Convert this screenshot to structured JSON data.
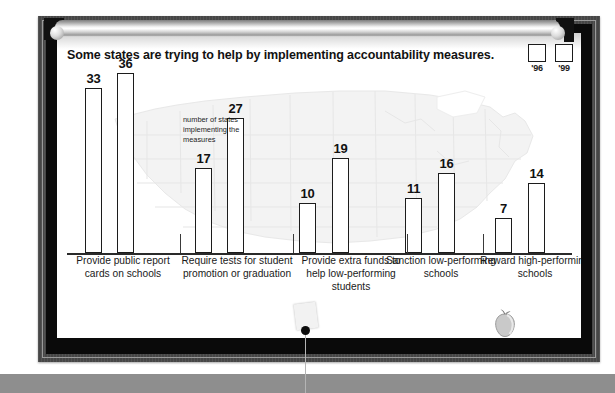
{
  "title": "Some states are trying to help by implementing accountability measures.",
  "annotation": "number of states implementing the measures",
  "legend": [
    {
      "label": "'96"
    },
    {
      "label": "'99"
    }
  ],
  "colors": {
    "bar_fill": "#ffffff",
    "bar_outline": "#1c1c1c",
    "frame": "#4a4a4a",
    "matte": "#0a0a0a",
    "bottom_band": "#8e8e8e",
    "text": "#111111"
  },
  "chart_data": {
    "type": "bar",
    "title": "Some states are trying to help by implementing accountability measures.",
    "xlabel": "",
    "ylabel": "number of states implementing the measures",
    "ylim": [
      0,
      40
    ],
    "grid": false,
    "legend_position": "top-right",
    "categories": [
      "Provide public report cards on schools",
      "Require tests for student promotion or graduation",
      "Provide extra funds to help low-performing students",
      "Sanction low-performing schools",
      "Reward high-performing schools"
    ],
    "series": [
      {
        "name": "'96",
        "values": [
          33,
          17,
          10,
          11,
          7
        ]
      },
      {
        "name": "'99",
        "values": [
          36,
          27,
          19,
          16,
          14
        ]
      }
    ],
    "data_labels": [
      33,
      36,
      17,
      27,
      10,
      19,
      11,
      16,
      7,
      14
    ]
  },
  "bars": [
    {
      "value": "33",
      "x": 28,
      "w": 17,
      "h": 165
    },
    {
      "value": "36",
      "x": 60,
      "w": 17,
      "h": 180
    },
    {
      "value": "17",
      "x": 138,
      "w": 17,
      "h": 85
    },
    {
      "value": "27",
      "x": 170,
      "w": 17,
      "h": 135
    },
    {
      "value": "10",
      "x": 242,
      "w": 17,
      "h": 50
    },
    {
      "value": "19",
      "x": 275,
      "w": 17,
      "h": 95
    },
    {
      "value": "11",
      "x": 348,
      "w": 17,
      "h": 55
    },
    {
      "value": "16",
      "x": 381,
      "w": 17,
      "h": 80
    },
    {
      "value": "7",
      "x": 438,
      "w": 17,
      "h": 35
    },
    {
      "value": "14",
      "x": 471,
      "w": 17,
      "h": 70
    }
  ],
  "categories": [
    {
      "label": "Provide public report cards on schools",
      "left": 0,
      "width": 112,
      "tick": 113
    },
    {
      "label": "Require tests for student promotion or graduation",
      "left": 114,
      "width": 112,
      "tick": 226
    },
    {
      "label": "Provide extra funds to help low-performing students",
      "left": 228,
      "width": 112,
      "tick": 340
    },
    {
      "label": "Sanction low-performing schools",
      "left": 318,
      "width": 112,
      "tick": 416
    },
    {
      "label": "Reward high-performing schools",
      "left": 412,
      "width": 112,
      "tick": 0
    }
  ]
}
